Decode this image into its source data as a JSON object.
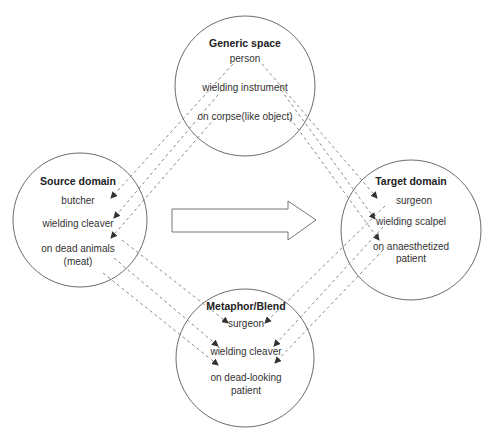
{
  "spaces": {
    "generic": {
      "title": "Generic space",
      "items": [
        "person",
        "wielding instrument",
        "on corpse(like object)"
      ]
    },
    "source": {
      "title": "Source domain",
      "items": [
        "butcher",
        "wielding cleaver",
        "on dead animals",
        "(meat)"
      ]
    },
    "target": {
      "title": "Target domain",
      "items": [
        "surgeon",
        "wielding scalpel",
        "on anaesthetized",
        "patient"
      ]
    },
    "blend": {
      "title": "Metaphor/Blend",
      "items": [
        "surgeon",
        "wielding cleaver",
        "on dead-looking",
        "patient"
      ]
    }
  },
  "central_arrow": {
    "direction": "source-to-target"
  },
  "colors": {
    "circle_stroke": "#6b6b6b",
    "dashed_line": "#8a8a8a",
    "arrowhead": "#333333",
    "text": "#333333"
  }
}
